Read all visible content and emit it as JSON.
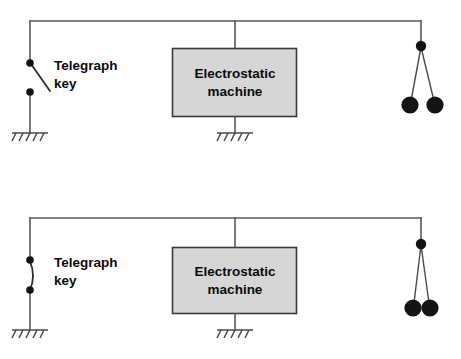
{
  "figure": {
    "panel_count": 2,
    "colors": {
      "wire": "#58585a",
      "box_fill": "#d6d6d6",
      "box_stroke": "#3b3b3b",
      "dot": "#131313",
      "ball": "#141414",
      "text": "#0b0b0b",
      "background": "#ffffff"
    }
  },
  "panels": [
    {
      "id": "panel-top",
      "state": "key-open",
      "telegraph_key": {
        "label_line1": "Telegraph",
        "label_line2": "key",
        "contacts": 2,
        "switch_state": "open"
      },
      "machine": {
        "label_line1": "Electrostatic",
        "label_line2": "machine"
      },
      "electroscope": {
        "ball_count": 2,
        "separation": "wide",
        "state": "repelling"
      },
      "ground_count": 3
    },
    {
      "id": "panel-bottom",
      "state": "key-closed",
      "telegraph_key": {
        "label_line1": "Telegraph",
        "label_line2": "key",
        "contacts": 2,
        "switch_state": "closed"
      },
      "machine": {
        "label_line1": "Electrostatic",
        "label_line2": "machine"
      },
      "electroscope": {
        "ball_count": 2,
        "separation": "narrow",
        "state": "touching"
      },
      "ground_count": 3
    }
  ]
}
